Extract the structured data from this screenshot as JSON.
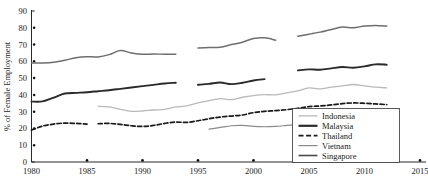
{
  "chart_data": {
    "type": "line",
    "title": "",
    "xlabel": "",
    "ylabel": "% of Female Employment",
    "xlim": [
      1980,
      2015
    ],
    "ylim": [
      0,
      90
    ],
    "xticks": [
      1980,
      1985,
      1990,
      1995,
      2000,
      2005,
      2010,
      2015
    ],
    "yticks": [
      0,
      10,
      20,
      30,
      40,
      50,
      60,
      70,
      80,
      90
    ],
    "grid": false,
    "legend_position": "bottom-right",
    "series": [
      {
        "name": "Indonesia",
        "color": "#b9b9b9",
        "style": "solid",
        "width": 1.3,
        "segments": [
          {
            "x": [
              1986,
              1987,
              1988,
              1989,
              1990,
              1991,
              1992,
              1993,
              1994,
              1995,
              1996,
              1997,
              1998,
              1999,
              2000,
              2001,
              2002,
              2003,
              2004,
              2005,
              2006,
              2007,
              2008,
              2009,
              2010,
              2011,
              2012
            ],
            "y": [
              33.2,
              32.8,
              31.4,
              30.2,
              30.4,
              31.0,
              31.4,
              32.8,
              33.4,
              35.2,
              36.6,
              37.8,
              37.2,
              38.6,
              39.6,
              40.2,
              40.0,
              41.2,
              42.4,
              44.2,
              43.6,
              44.6,
              45.4,
              46.2,
              45.4,
              44.6,
              44.2
            ]
          }
        ]
      },
      {
        "name": "Malaysia",
        "color": "#2a2a2a",
        "style": "solid",
        "width": 1.9,
        "segments": [
          {
            "x": [
              1980,
              1981,
              1982,
              1983,
              1984,
              1985,
              1986,
              1987,
              1988,
              1989,
              1990,
              1991,
              1992,
              1993
            ],
            "y": [
              36.0,
              36.1,
              38.4,
              40.8,
              41.2,
              41.6,
              42.2,
              42.8,
              43.6,
              44.4,
              45.2,
              46.0,
              46.8,
              47.2
            ]
          },
          {
            "x": [
              1995,
              1996,
              1997,
              1998,
              1999,
              2000,
              2001
            ],
            "y": [
              46.0,
              46.6,
              47.4,
              46.4,
              47.2,
              48.6,
              49.4
            ]
          },
          {
            "x": [
              2004,
              2005,
              2006,
              2007,
              2008,
              2009,
              2010,
              2011,
              2012
            ],
            "y": [
              54.6,
              55.2,
              55.0,
              55.8,
              56.6,
              56.2,
              57.0,
              58.2,
              58.0
            ]
          }
        ]
      },
      {
        "name": "Thailand",
        "color": "#1a1a1a",
        "style": "dashed",
        "width": 1.7,
        "segments": [
          {
            "x": [
              1980,
              1981,
              1982,
              1983,
              1984,
              1985
            ],
            "y": [
              19.0,
              21.4,
              22.6,
              23.2,
              23.0,
              22.6
            ]
          },
          {
            "x": [
              1986,
              1987,
              1988,
              1989,
              1990,
              1991,
              1992,
              1993,
              1994,
              1995,
              1996,
              1997,
              1998,
              1999,
              2000,
              2001,
              2002,
              2003,
              2004,
              2005,
              2006,
              2007,
              2008,
              2009,
              2010,
              2011,
              2012
            ],
            "y": [
              22.8,
              23.0,
              22.4,
              21.6,
              21.2,
              21.8,
              23.0,
              23.8,
              23.6,
              24.6,
              25.8,
              26.8,
              27.4,
              28.0,
              29.4,
              30.2,
              30.6,
              31.2,
              32.0,
              33.0,
              33.4,
              34.0,
              34.8,
              35.2,
              35.0,
              34.6,
              34.2
            ]
          }
        ]
      },
      {
        "name": "Vietnam",
        "color": "#8a8a8a",
        "style": "solid",
        "width": 1.2,
        "segments": [
          {
            "x": [
              1996,
              1997,
              1998,
              1999,
              2000,
              2001,
              2002,
              2003,
              2004
            ],
            "y": [
              19.6,
              20.6,
              21.6,
              21.8,
              21.2,
              21.0,
              21.2,
              21.8,
              22.4
            ]
          }
        ]
      },
      {
        "name": "Singapore",
        "color": "#6e6e6e",
        "style": "solid",
        "width": 1.5,
        "segments": [
          {
            "x": [
              1980,
              1981,
              1982,
              1983,
              1984,
              1985,
              1986,
              1987,
              1988,
              1989,
              1990,
              1991,
              1992,
              1993
            ],
            "y": [
              59.0,
              59.0,
              59.4,
              60.6,
              62.2,
              62.8,
              62.6,
              64.0,
              66.4,
              65.0,
              64.2,
              64.4,
              64.2,
              64.2
            ]
          },
          {
            "x": [
              1995,
              1996,
              1997,
              1998,
              1999,
              2000,
              2001,
              2002
            ],
            "y": [
              68.0,
              68.2,
              68.4,
              70.0,
              71.4,
              73.6,
              74.0,
              72.6
            ]
          },
          {
            "x": [
              2004,
              2005,
              2006,
              2007,
              2008,
              2009,
              2010,
              2011,
              2012
            ],
            "y": [
              75.0,
              76.2,
              77.4,
              79.0,
              80.4,
              80.0,
              81.0,
              81.4,
              81.0
            ]
          }
        ]
      }
    ],
    "legend_entries": [
      {
        "label": "Indonesia",
        "color": "#b9b9b9",
        "style": "solid",
        "width": 1.3
      },
      {
        "label": "Malaysia",
        "color": "#2a2a2a",
        "style": "solid",
        "width": 2.2
      },
      {
        "label": "Thailand",
        "color": "#1a1a1a",
        "style": "dashed",
        "width": 1.7
      },
      {
        "label": "Vietnam",
        "color": "#8a8a8a",
        "style": "solid",
        "width": 1.2
      },
      {
        "label": "Singapore",
        "color": "#4a4a4a",
        "style": "solid",
        "width": 1.6
      }
    ]
  }
}
